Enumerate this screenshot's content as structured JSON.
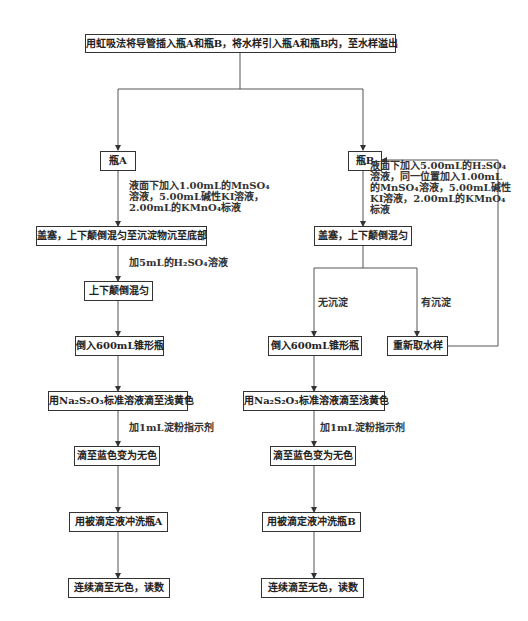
{
  "diagram": {
    "type": "flowchart",
    "start": "用虹吸法将导管插入瓶A和瓶B，将水样引入瓶A和瓶B内，至水样溢出",
    "branch_a": {
      "title": "瓶A",
      "step1_note": [
        "液面下加入1.00mL的MnSO₄",
        "溶液，5.00mL碱性KI溶液，",
        "2.00mL的KMnO₄标液"
      ],
      "step2": "盖塞，上下颠倒混匀至沉淀物沉至底部",
      "step2_note": "加5mL的H₂SO₄溶液",
      "step3": "上下颠倒混匀",
      "step4": "倒入600mL锥形瓶",
      "step5": "用Na₂S₂O₃标准溶液滴至浅黄色",
      "step5_note": "加1mL淀粉指示剂",
      "step6": "滴至蓝色变为无色",
      "step7": "用被滴定液冲洗瓶A",
      "step8": "连续滴至无色，读数"
    },
    "branch_b": {
      "title": "瓶B",
      "step1_note": [
        "液面下加入5.00mL的H₂SO₄",
        "溶液，同一位置加入1.00mL",
        "的MnSO₄溶液，5.00mL碱性",
        "KI溶液，2.00mL的KMnO₄",
        "标液"
      ],
      "step2": "盖塞，上下颠倒混匀",
      "no_precipitate_label": "无沉淀",
      "precipitate_label": "有沉淀",
      "resample": "重新取水样",
      "step4": "倒入600mL锥形瓶",
      "step5": "用Na₂S₂O₃标准溶液滴至浅黄色",
      "step5_note": "加1mL淀粉指示剂",
      "step6": "滴至蓝色变为无色",
      "step7": "用被滴定液冲洗瓶B",
      "step8": "连续滴至无色，读数"
    },
    "colors": {
      "line": "#555555",
      "box_border": "#333333",
      "text": "#222222"
    }
  }
}
